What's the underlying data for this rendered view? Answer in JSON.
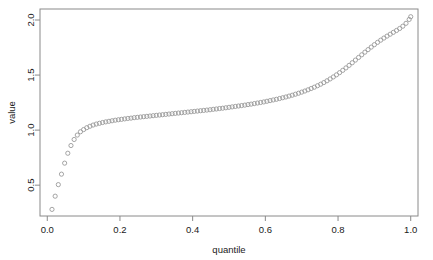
{
  "chart_data": {
    "type": "scatter",
    "title": "",
    "xlabel": "quantile",
    "ylabel": "value",
    "xlim": [
      -0.02,
      1.02
    ],
    "ylim": [
      0.22,
      2.1
    ],
    "grid": false,
    "legend": null,
    "marker": "open-circle",
    "marker_color": "#9a9a9a",
    "xticks": [
      0.0,
      0.2,
      0.4,
      0.6,
      0.8,
      1.0
    ],
    "xticklabels": [
      "0.0",
      "0.2",
      "0.4",
      "0.6",
      "0.8",
      "1.0"
    ],
    "yticks": [
      0.5,
      1.0,
      1.5,
      2.0
    ],
    "yticklabels": [
      "0.5",
      "1.0",
      "1.5",
      "2.0"
    ],
    "x": [
      0.013,
      0.0217,
      0.0304,
      0.0391,
      0.0478,
      0.0565,
      0.0652,
      0.0739,
      0.0826,
      0.0913,
      0.1,
      0.1087,
      0.1174,
      0.1261,
      0.1348,
      0.1435,
      0.1522,
      0.1609,
      0.1696,
      0.1783,
      0.187,
      0.1957,
      0.2043,
      0.213,
      0.2217,
      0.2304,
      0.2391,
      0.2478,
      0.2565,
      0.2652,
      0.2739,
      0.2826,
      0.2913,
      0.3,
      0.3087,
      0.3174,
      0.3261,
      0.3348,
      0.3435,
      0.3522,
      0.3609,
      0.3696,
      0.3783,
      0.387,
      0.3957,
      0.4043,
      0.413,
      0.4217,
      0.4304,
      0.4391,
      0.4478,
      0.4565,
      0.4652,
      0.4739,
      0.4826,
      0.4913,
      0.5,
      0.5087,
      0.5174,
      0.5261,
      0.5348,
      0.5435,
      0.5522,
      0.5609,
      0.5696,
      0.5783,
      0.587,
      0.5957,
      0.6043,
      0.613,
      0.6217,
      0.6304,
      0.6391,
      0.6478,
      0.6565,
      0.6652,
      0.6739,
      0.6826,
      0.6913,
      0.7,
      0.7087,
      0.7174,
      0.7261,
      0.7348,
      0.7435,
      0.7522,
      0.7609,
      0.7696,
      0.7783,
      0.787,
      0.7957,
      0.8043,
      0.813,
      0.8217,
      0.8304,
      0.8391,
      0.8478,
      0.8565,
      0.8652,
      0.8739,
      0.8826,
      0.8913,
      0.9,
      0.9087,
      0.9174,
      0.9261,
      0.9348,
      0.9435,
      0.9522,
      0.9609,
      0.9696,
      0.9783,
      0.987,
      0.9957,
      1.0
    ],
    "y": [
      0.28,
      0.4,
      0.505,
      0.6,
      0.7,
      0.79,
      0.86,
      0.915,
      0.955,
      0.985,
      1.005,
      1.022,
      1.035,
      1.046,
      1.055,
      1.062,
      1.069,
      1.075,
      1.08,
      1.085,
      1.09,
      1.094,
      1.098,
      1.102,
      1.106,
      1.109,
      1.113,
      1.116,
      1.119,
      1.122,
      1.125,
      1.128,
      1.131,
      1.134,
      1.137,
      1.14,
      1.143,
      1.146,
      1.149,
      1.152,
      1.155,
      1.158,
      1.161,
      1.164,
      1.167,
      1.17,
      1.173,
      1.176,
      1.179,
      1.182,
      1.185,
      1.189,
      1.192,
      1.196,
      1.199,
      1.203,
      1.207,
      1.211,
      1.215,
      1.219,
      1.223,
      1.227,
      1.232,
      1.236,
      1.241,
      1.246,
      1.251,
      1.256,
      1.262,
      1.268,
      1.274,
      1.28,
      1.287,
      1.294,
      1.301,
      1.309,
      1.317,
      1.326,
      1.335,
      1.345,
      1.355,
      1.366,
      1.378,
      1.39,
      1.403,
      1.417,
      1.432,
      1.448,
      1.465,
      1.483,
      1.502,
      1.522,
      1.543,
      1.565,
      1.588,
      1.612,
      1.636,
      1.66,
      1.684,
      1.708,
      1.731,
      1.754,
      1.776,
      1.797,
      1.817,
      1.836,
      1.854,
      1.871,
      1.888,
      1.905,
      1.923,
      1.944,
      1.97,
      2.005,
      2.03
    ]
  },
  "axes": {
    "x_title": "quantile",
    "y_title": "value"
  }
}
